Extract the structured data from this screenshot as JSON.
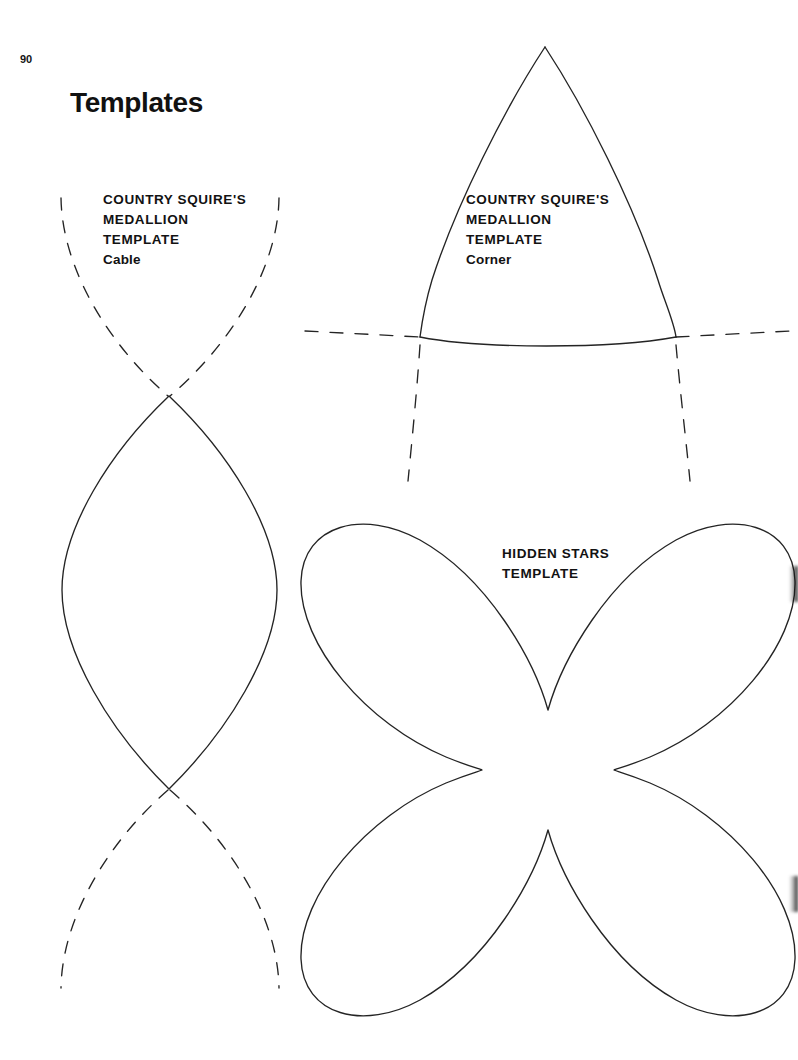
{
  "page": {
    "number": "90",
    "title": "Templates",
    "width": 798,
    "height": 1060,
    "background_color": "#ffffff",
    "ink_color": "#222222"
  },
  "templates": [
    {
      "id": "country-squires-medallion-cable",
      "name": "Country Squire's Medallion Template — Cable",
      "label_lines": [
        "COUNTRY SQUIRE'S",
        "MEDALLION",
        "TEMPLATE"
      ],
      "variant_line": "Cable",
      "shape": "pointed-oval-lens",
      "solid_outline": true,
      "dashed_extensions": "top and bottom mirrored arcs"
    },
    {
      "id": "country-squires-medallion-corner",
      "name": "Country Squire's Medallion Template — Corner",
      "label_lines": [
        "COUNTRY SQUIRE'S",
        "MEDALLION",
        "TEMPLATE"
      ],
      "variant_line": "Corner",
      "shape": "pointed-ogive-dome",
      "solid_outline": true,
      "dashed_extensions": "horizontal baseline and downward side lines"
    },
    {
      "id": "hidden-stars",
      "name": "Hidden Stars Template",
      "label_lines": [
        "HIDDEN STARS",
        "TEMPLATE"
      ],
      "variant_line": "",
      "shape": "four-petal-clover",
      "solid_outline": true,
      "dashed_extensions": ""
    }
  ],
  "labels": {
    "cable": {
      "line1": "COUNTRY SQUIRE'S",
      "line2": "MEDALLION",
      "line3": "TEMPLATE",
      "line4": "Cable"
    },
    "corner": {
      "line1": "COUNTRY SQUIRE'S",
      "line2": "MEDALLION",
      "line3": "TEMPLATE",
      "line4": "Corner"
    },
    "stars": {
      "line1": "HIDDEN STARS",
      "line2": "TEMPLATE"
    }
  },
  "artifacts": {
    "right_edge_smudge_top": "scan shadow",
    "right_edge_smudge_bottom": "scan shadow"
  }
}
